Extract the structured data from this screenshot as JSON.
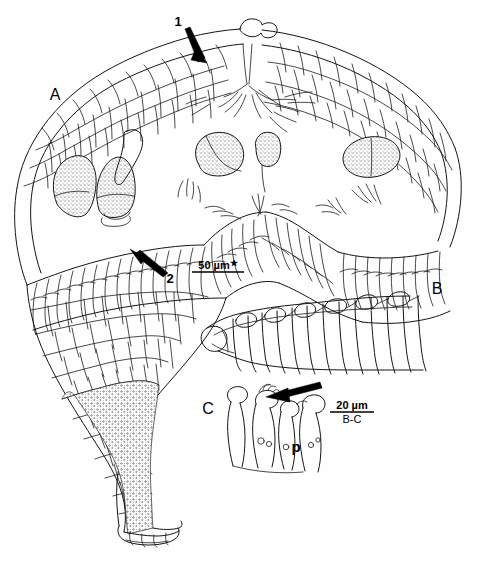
{
  "figure": {
    "background_color": "#fefefe",
    "ink_color": "#151515",
    "width": 480,
    "height": 567,
    "caption_present": false
  },
  "panels": [
    {
      "id": "A",
      "label": "A",
      "label_x": 55,
      "label_y": 100,
      "description": "Longitudinal section of gall / leaf tissue with stalk"
    },
    {
      "id": "B",
      "label": "B",
      "label_x": 437,
      "label_y": 294,
      "description": "Row of elongate cells with small apical cells"
    },
    {
      "id": "C",
      "label": "C",
      "label_x": 208,
      "label_y": 414,
      "description": "Cluster of cells with paraphysis"
    }
  ],
  "annotations": {
    "numbered": [
      {
        "name": "callout-1",
        "text": "1",
        "text_x": 178,
        "text_y": 26,
        "arrow_from": [
          186,
          29
        ],
        "arrow_to": [
          200,
          57
        ]
      },
      {
        "name": "callout-2",
        "text": "2",
        "text_x": 168,
        "text_y": 281,
        "arrow_from": [
          164,
          276
        ],
        "arrow_to": [
          134,
          253
        ]
      }
    ],
    "letters": [
      {
        "name": "paraphysis-label",
        "text": "p",
        "text_x": 296,
        "text_y": 452
      }
    ],
    "plain_arrows": [
      {
        "name": "panel-c-arrow",
        "arrow_from": [
          318,
          385
        ],
        "arrow_to": [
          268,
          397
        ]
      }
    ]
  },
  "scale_bars": [
    {
      "name": "scale-bar-a",
      "value": "50 µm",
      "marker": "★",
      "sublabel": "",
      "x": 192,
      "y": 265,
      "bar_width": 52
    },
    {
      "name": "scale-bar-bc",
      "value": "20 µm",
      "marker": "",
      "sublabel": "B-C",
      "x": 330,
      "y": 406,
      "bar_width": 44
    }
  ]
}
